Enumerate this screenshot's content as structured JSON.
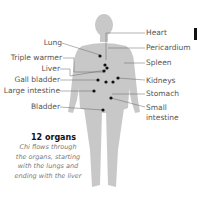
{
  "diagram": {
    "left_labels": [
      "Lung",
      "Triple warmer",
      "Liver",
      "Gall bladder",
      "Large intestine",
      "Bladder"
    ],
    "right_labels": [
      "Heart",
      "Pericardium",
      "Spleen",
      "Kidneys",
      "Stomach",
      "Small",
      "intestine"
    ],
    "title": "12 organs",
    "description": "Chi flows through the organs, starting with the lungs and ending with the liver"
  }
}
